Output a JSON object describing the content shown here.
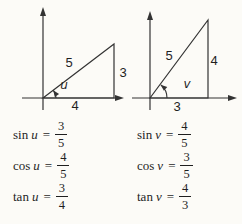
{
  "figure": {
    "colors": {
      "background": "#fcfbf7",
      "line": "#333333",
      "text": "#1f1f1f"
    },
    "diagrams": {
      "left": {
        "hypotenuse_label": "5",
        "opposite_label": "3",
        "adjacent_label": "4",
        "angle_label": "u"
      },
      "right": {
        "hypotenuse_label": "5",
        "opposite_label": "4",
        "adjacent_label": "3",
        "angle_label": "v"
      }
    },
    "formulas": {
      "left": [
        {
          "func": "sin",
          "var": "u",
          "eq": "=",
          "num": "3",
          "den": "5"
        },
        {
          "func": "cos",
          "var": "u",
          "eq": "=",
          "num": "4",
          "den": "5"
        },
        {
          "func": "tan",
          "var": "u",
          "eq": "=",
          "num": "3",
          "den": "4"
        }
      ],
      "right": [
        {
          "func": "sin",
          "var": "v",
          "eq": "=",
          "num": "4",
          "den": "5"
        },
        {
          "func": "cos",
          "var": "v",
          "eq": "=",
          "num": "3",
          "den": "5"
        },
        {
          "func": "tan",
          "var": "v",
          "eq": "=",
          "num": "4",
          "den": "3"
        }
      ]
    }
  }
}
